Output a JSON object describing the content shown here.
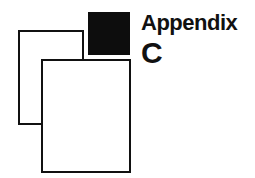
{
  "heading": {
    "word": "Appendix",
    "letter": "C"
  },
  "colors": {
    "ink": "#111111",
    "background": "#ffffff"
  }
}
